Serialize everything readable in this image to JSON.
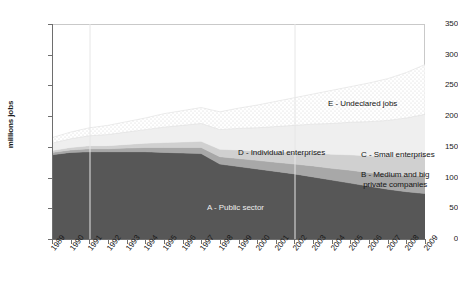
{
  "chart_data": {
    "type": "area",
    "title": "",
    "xlabel": "",
    "ylabel": "millions jobs",
    "ylim": [
      0,
      350
    ],
    "yticks": [
      0,
      50,
      100,
      150,
      200,
      250,
      300,
      350
    ],
    "grid": true,
    "stacked": true,
    "legend_position": "inline-annotations",
    "categories": [
      "1989",
      "1990",
      "1991",
      "1992",
      "1993",
      "1994",
      "1995",
      "1996",
      "1997",
      "1998",
      "1999",
      "2000",
      "2001",
      "2002",
      "2003",
      "2004",
      "2005",
      "2006",
      "2007",
      "2008",
      "2009"
    ],
    "series": [
      {
        "key": "A",
        "name": "A - Public sector",
        "color": "#575757",
        "values": [
          137,
          141,
          142,
          142,
          142,
          142,
          141,
          140,
          139,
          122,
          118,
          114,
          110,
          106,
          101,
          96,
          91,
          86,
          81,
          77,
          74
        ]
      },
      {
        "key": "B",
        "name": "B - Medium and big private companies",
        "color": "#a8a8a8",
        "values": [
          4,
          4,
          5,
          5,
          6,
          7,
          8,
          9,
          10,
          12,
          13,
          14,
          15,
          16,
          18,
          19,
          21,
          22,
          24,
          26,
          29
        ]
      },
      {
        "key": "C",
        "name": "C - Small enterprises",
        "color": "#d0d0d0",
        "values": [
          3,
          4,
          5,
          5,
          6,
          7,
          8,
          9,
          10,
          12,
          14,
          15,
          17,
          19,
          21,
          23,
          25,
          27,
          29,
          32,
          35
        ]
      },
      {
        "key": "D",
        "name": "D - Individual enterprises",
        "color": "#efefef",
        "values": [
          12,
          14,
          16,
          18,
          20,
          22,
          25,
          27,
          29,
          32,
          35,
          38,
          41,
          44,
          47,
          50,
          53,
          56,
          59,
          62,
          65
        ]
      },
      {
        "key": "E",
        "name": "E - Undeclared jobs",
        "color": "#ffffff",
        "pattern": "dotted",
        "values": [
          9,
          11,
          13,
          15,
          17,
          19,
          22,
          24,
          26,
          29,
          33,
          37,
          41,
          45,
          49,
          54,
          58,
          63,
          68,
          74,
          81
        ]
      }
    ],
    "totals": [
      165,
      174,
      181,
      185,
      191,
      197,
      204,
      209,
      214,
      207,
      213,
      218,
      224,
      230,
      236,
      242,
      248,
      254,
      261,
      271,
      284
    ],
    "annotations": [
      {
        "id": "label-a",
        "text": "A - Public sector",
        "x": 207,
        "y": 205,
        "style": "on-dark"
      },
      {
        "id": "label-b",
        "text": "B - Medium and big",
        "text2": "private companies",
        "x": 364,
        "y": 174
      },
      {
        "id": "label-c",
        "text": "C - Small enterprises",
        "x": 364,
        "y": 152
      },
      {
        "id": "label-d",
        "text": "D - Individual enterprises",
        "x": 240,
        "y": 153
      },
      {
        "id": "label-e",
        "text": "E - Undeclared jobs",
        "x": 330,
        "y": 104
      }
    ]
  },
  "axes": {
    "y_tick_labels": [
      "350",
      "300",
      "250",
      "200",
      "150",
      "100",
      "50",
      "0"
    ],
    "y_axis_title": "millions jobs",
    "x_tick_labels": [
      "1989",
      "1990",
      "1991",
      "1992",
      "1993",
      "1994",
      "1995",
      "1996",
      "1997",
      "1998",
      "1999",
      "2000",
      "2001",
      "2002",
      "2003",
      "2004",
      "2005",
      "2006",
      "2007",
      "2008",
      "2009"
    ]
  },
  "labels": {
    "a": "A - Public sector",
    "b_line1": "B - Medium and big",
    "b_line2": "private companies",
    "c": "C - Small enterprises",
    "d": "D - Individual enterprises",
    "e": "E - Undeclared jobs"
  },
  "colors": {
    "series_a": "#575757",
    "series_b": "#a8a8a8",
    "series_c": "#d0d0d0",
    "series_d": "#efefef",
    "series_e": "#ffffff",
    "grid": "#d2d2d2",
    "axis": "#6e6e6e",
    "text": "#1a1a1a"
  }
}
